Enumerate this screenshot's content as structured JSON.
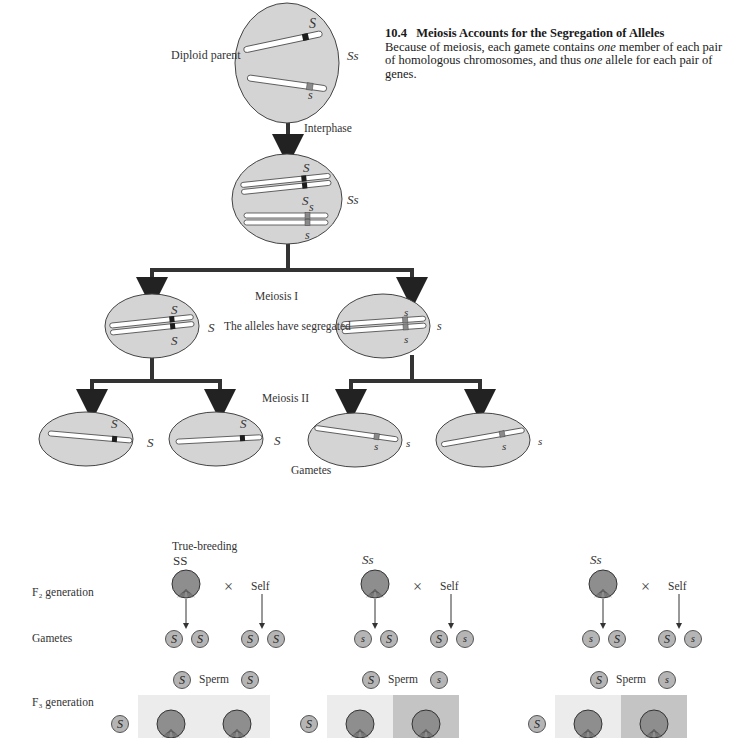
{
  "caption": {
    "number": "10.4",
    "title": "Meiosis Accounts for the Segregation of Alleles",
    "body_parts": [
      {
        "text": "Because of meiosis, each gamete contains ",
        "italic": false
      },
      {
        "text": "one",
        "italic": true
      },
      {
        "text": " member of each pair of homologous chromosomes, and thus ",
        "italic": false
      },
      {
        "text": "one",
        "italic": true
      },
      {
        "text": " allele for each pair of genes.",
        "italic": false
      }
    ]
  },
  "meiosis": {
    "diploid_parent_label": "Diploid parent",
    "parent_genotype": "Ss",
    "interphase_label": "Interphase",
    "interphase_genotype": "Ss",
    "meiosis1_label": "Meiosis I",
    "segregated_label": "The alleles have segregated",
    "meiosis2_label": "Meiosis II",
    "gametes_label": "Gametes",
    "cell_alleles": {
      "parent_top": "S",
      "parent_bottom": "s",
      "interphase_top": "S",
      "interphase_mid_S": "S",
      "interphase_mid_s": "s",
      "interphase_bottom": "s",
      "m1_left_top": "S",
      "m1_left_bottom": "S",
      "m1_left_side": "S",
      "m1_right_top": "s",
      "m1_right_bottom": "s",
      "m1_right_side": "s",
      "gamete1": "S",
      "gamete1_side": "S",
      "gamete2": "S",
      "gamete2_side": "S",
      "gamete3": "s",
      "gamete3_side": "s",
      "gamete4": "s",
      "gamete4_side": "s"
    }
  },
  "crosses": {
    "row_labels": {
      "f2": "F₂ generation",
      "gametes": "Gametes",
      "f3": "F₃ generation"
    },
    "true_breeding_label": "True-breeding",
    "cross_symbol": "×",
    "self_label": "Self",
    "sperm_label": "Sperm",
    "panels": [
      {
        "genotype": "SS",
        "gametes": [
          "S",
          "S",
          "S",
          "S"
        ],
        "sperm": [
          "S",
          "S"
        ],
        "egg": "S",
        "square_shades": [
          "light",
          "light"
        ]
      },
      {
        "genotype": "Ss",
        "gametes": [
          "s",
          "S",
          "S",
          "s"
        ],
        "sperm": [
          "S",
          "s"
        ],
        "egg": "S",
        "square_shades": [
          "light",
          "dark"
        ]
      },
      {
        "genotype": "Ss",
        "gametes": [
          "s",
          "S",
          "S",
          "s"
        ],
        "sperm": [
          "S",
          "s"
        ],
        "egg": "S",
        "square_shades": [
          "light",
          "dark"
        ]
      }
    ]
  },
  "colors": {
    "cell_fill": "#d4d4d4",
    "dominant_band": "#1e1e1e",
    "recessive_band": "#8a8a8a",
    "arrow": "#333333",
    "square_light": "#ececec",
    "square_dark": "#c4c4c4",
    "seed_fill": "#8e8e8e",
    "gamete_fill": "#b5b5b5"
  }
}
